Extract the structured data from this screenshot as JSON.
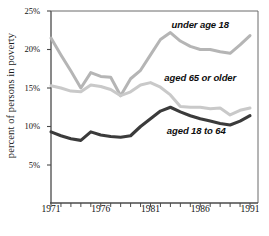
{
  "chart_data": {
    "type": "line",
    "title": "",
    "xlabel": "",
    "ylabel": "percent of persons in poverty",
    "xlim": [
      1971,
      1991
    ],
    "ylim": [
      0,
      25
    ],
    "yaxis_display_min": 2.5,
    "grid": false,
    "legend": "inline-annotations",
    "x": [
      1971,
      1972,
      1973,
      1974,
      1975,
      1976,
      1977,
      1978,
      1979,
      1980,
      1981,
      1982,
      1983,
      1984,
      1985,
      1986,
      1987,
      1988,
      1989,
      1990,
      1991
    ],
    "ytick_labels": [
      "25%",
      "20%",
      "15%",
      "10%",
      "5%"
    ],
    "ytick_values": [
      25,
      20,
      15,
      10,
      5
    ],
    "xtick_labels": [
      "1971",
      "1976",
      "1981",
      "1986",
      "1991"
    ],
    "xtick_values": [
      1971,
      1976,
      1981,
      1986,
      1991
    ],
    "series": [
      {
        "name": "under age 18",
        "color": "#b5b5b5",
        "label_x": 1986.0,
        "label_y": 23.2,
        "values": [
          21.5,
          19.3,
          17.2,
          15.0,
          17.0,
          16.5,
          16.4,
          14.0,
          16.2,
          17.3,
          19.3,
          21.3,
          22.2,
          21.1,
          20.4,
          20.0,
          20.0,
          19.7,
          19.5,
          20.6,
          21.8
        ]
      },
      {
        "name": "aged 65 or older",
        "color": "#c9c9c9",
        "label_x": 1986.0,
        "label_y": 16.3,
        "values": [
          15.3,
          15.0,
          14.6,
          14.5,
          15.4,
          15.2,
          14.8,
          14.0,
          14.5,
          15.4,
          15.7,
          15.1,
          14.1,
          12.6,
          12.5,
          12.5,
          12.3,
          12.4,
          11.5,
          12.1,
          12.4
        ]
      },
      {
        "name": "aged 18 to 64",
        "color": "#3b3b3b",
        "label_x": 1985.6,
        "label_y": 9.4,
        "values": [
          9.3,
          8.8,
          8.4,
          8.2,
          9.3,
          8.9,
          8.7,
          8.6,
          8.8,
          10.0,
          11.0,
          12.0,
          12.5,
          11.9,
          11.4,
          11.0,
          10.7,
          10.4,
          10.2,
          10.7,
          11.4
        ]
      }
    ]
  },
  "axes": {
    "y_title": "percent of persons in poverty"
  }
}
